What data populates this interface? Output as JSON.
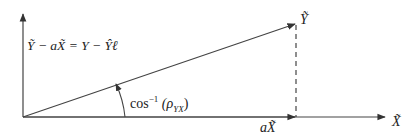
{
  "diagram": {
    "type": "vector-projection",
    "labels": {
      "y_vector": "Ỹ",
      "x_axis": "X̃",
      "projection": "aX̃",
      "residual_formula": "Ỹ − aX̃ = Y − Ŷℓ",
      "angle_prefix": "cos",
      "angle_exponent": "−1",
      "angle_arg_open": "(ρ",
      "angle_arg_sub": "YX",
      "angle_arg_close": ")"
    },
    "colors": {
      "line": "#333333",
      "background": "#ffffff"
    }
  }
}
